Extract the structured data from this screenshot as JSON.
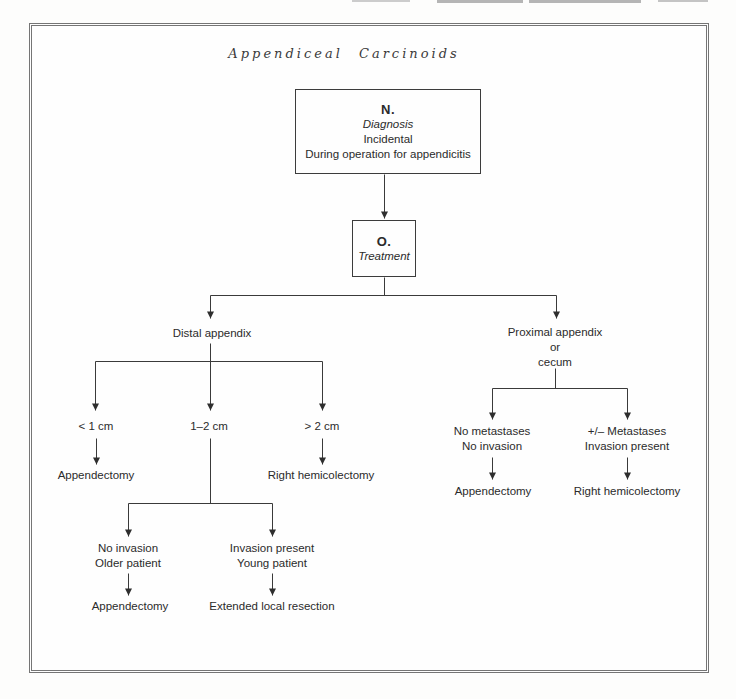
{
  "figure": {
    "title": "Appendiceal Carcinoids",
    "colors": {
      "ink": "#2b2b2b",
      "line": "#3a3a3a",
      "frame": "#757575"
    },
    "diagnosis_node": {
      "label": "N.",
      "role": "Diagnosis",
      "detail_lines": [
        "Incidental",
        "During operation for appendicitis"
      ]
    },
    "treatment_node": {
      "label": "O.",
      "role": "Treatment"
    },
    "distal_branch": {
      "label": "Distal appendix",
      "size_lt_1cm": {
        "label": "< 1 cm",
        "outcome": "Appendectomy"
      },
      "size_1_2cm": {
        "label": "1–2 cm",
        "no_invasion": {
          "lines": [
            "No invasion",
            "Older patient"
          ],
          "outcome": "Appendectomy"
        },
        "invasion": {
          "lines": [
            "Invasion present",
            "Young patient"
          ],
          "outcome": "Extended local resection"
        }
      },
      "size_gt_2cm": {
        "label": "> 2 cm",
        "outcome": "Right hemicolectomy"
      }
    },
    "proximal_branch": {
      "label_lines": [
        "Proximal appendix",
        "or",
        "cecum"
      ],
      "no_metastases": {
        "lines": [
          "No metastases",
          "No invasion"
        ],
        "outcome": "Appendectomy"
      },
      "metastases": {
        "lines": [
          "+/– Metastases",
          "Invasion present"
        ],
        "outcome": "Right hemicolectomy"
      }
    }
  }
}
